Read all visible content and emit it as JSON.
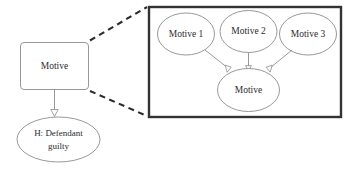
{
  "diagram": {
    "type": "causal-network-expansion",
    "left_nodes": [
      {
        "id": "motive-box",
        "label": "Motive",
        "shape": "rounded-rect"
      },
      {
        "id": "hypothesis-ellipse",
        "label": "H: Defendant guilty",
        "label_line1": "H: Defendant",
        "label_line2": "guilty",
        "shape": "ellipse"
      }
    ],
    "left_edges": [
      {
        "from": "motive-box",
        "to": "hypothesis-ellipse",
        "arrow": "open-triangle"
      }
    ],
    "connectors": [
      {
        "id": "zoom-connector-top",
        "style": "dashed"
      },
      {
        "id": "zoom-connector-bottom",
        "style": "dashed"
      }
    ],
    "panel": {
      "id": "expansion-panel",
      "nodes": [
        {
          "id": "motive-1",
          "label": "Motive 1",
          "shape": "ellipse"
        },
        {
          "id": "motive-2",
          "label": "Motive 2",
          "shape": "ellipse"
        },
        {
          "id": "motive-3",
          "label": "Motive 3",
          "shape": "ellipse"
        },
        {
          "id": "motive-aggregate",
          "label": "Motive",
          "shape": "ellipse"
        }
      ],
      "edges": [
        {
          "from": "motive-1",
          "to": "motive-aggregate",
          "arrow": "open-triangle"
        },
        {
          "from": "motive-2",
          "to": "motive-aggregate",
          "arrow": "open-triangle"
        },
        {
          "from": "motive-3",
          "to": "motive-aggregate",
          "arrow": "open-triangle"
        }
      ]
    }
  },
  "colors": {
    "shape_stroke": "#8c8c8c",
    "text": "#2b2b2b",
    "panel_border": "#333333",
    "dashed_connector": "#2b2b2b",
    "background": "#ffffff"
  }
}
